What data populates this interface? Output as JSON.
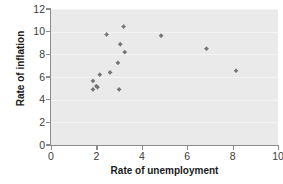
{
  "chart_data": {
    "type": "scatter",
    "title": "",
    "xlabel": "Rate of unemployment",
    "ylabel": "Rate of inflation",
    "xlim": [
      0,
      10
    ],
    "ylim": [
      0,
      12
    ],
    "xticks": [
      0,
      2,
      4,
      6,
      8,
      10
    ],
    "yticks": [
      0,
      2,
      4,
      6,
      8,
      10,
      12
    ],
    "grid": true,
    "grid_axis": "y",
    "legend": false,
    "marker": "diamond",
    "marker_color": "#737373",
    "plot_background": "#eaeaea",
    "points": [
      {
        "x": 1.85,
        "y": 5.65
      },
      {
        "x": 1.85,
        "y": 4.9
      },
      {
        "x": 2.0,
        "y": 5.2
      },
      {
        "x": 2.05,
        "y": 5.1
      },
      {
        "x": 2.15,
        "y": 6.2
      },
      {
        "x": 2.45,
        "y": 9.75
      },
      {
        "x": 2.6,
        "y": 6.4
      },
      {
        "x": 2.95,
        "y": 7.25
      },
      {
        "x": 3.0,
        "y": 4.9
      },
      {
        "x": 3.05,
        "y": 8.9
      },
      {
        "x": 3.2,
        "y": 10.45
      },
      {
        "x": 3.25,
        "y": 8.2
      },
      {
        "x": 4.85,
        "y": 9.65
      },
      {
        "x": 6.85,
        "y": 8.5
      },
      {
        "x": 8.15,
        "y": 6.55
      }
    ]
  },
  "axis": {
    "x_labels": [
      "0",
      "2",
      "4",
      "6",
      "8",
      "10"
    ],
    "y_labels": [
      "0",
      "2",
      "4",
      "6",
      "8",
      "10",
      "12"
    ],
    "x_title": "Rate of unemployment",
    "y_title": "Rate of inflation"
  }
}
